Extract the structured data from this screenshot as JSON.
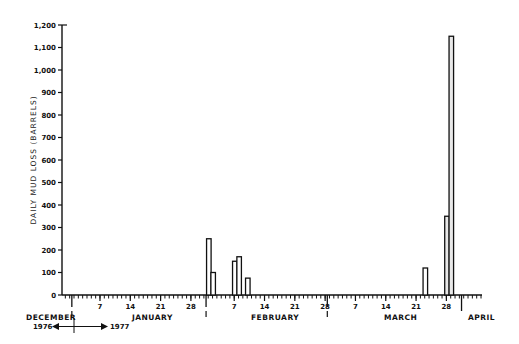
{
  "chart_data": {
    "type": "bar",
    "title": "",
    "xlabel": "",
    "ylabel": "DAILY MUD LOSS (BARRELS)",
    "ylim": [
      0,
      1200
    ],
    "yticks": [
      0,
      100,
      200,
      300,
      400,
      500,
      600,
      700,
      800,
      900,
      1000,
      1100,
      1200
    ],
    "ytick_labels": [
      "0",
      "100",
      "200",
      "300",
      "400",
      "500",
      "600",
      "700",
      "800",
      "900",
      "1,000",
      "1,100",
      "1,200"
    ],
    "grid": false,
    "x_day_ticks": [
      {
        "label": "7",
        "month": "January"
      },
      {
        "label": "14",
        "month": "January"
      },
      {
        "label": "21",
        "month": "January"
      },
      {
        "label": "28",
        "month": "January"
      },
      {
        "label": "7",
        "month": "February"
      },
      {
        "label": "14",
        "month": "February"
      },
      {
        "label": "21",
        "month": "February"
      },
      {
        "label": "28",
        "month": "February"
      },
      {
        "label": "7",
        "month": "March"
      },
      {
        "label": "14",
        "month": "March"
      },
      {
        "label": "21",
        "month": "March"
      },
      {
        "label": "28",
        "month": "March"
      }
    ],
    "month_labels": [
      "DECEMBER",
      "JANUARY",
      "FEBRUARY",
      "MARCH",
      "APRIL"
    ],
    "year_annotation": {
      "left": "1976",
      "right": "1977"
    },
    "categories": [
      "Feb 1",
      "Feb 2",
      "Feb 7",
      "Feb 8",
      "Feb 10",
      "Mar 23",
      "Mar 28",
      "Mar 29"
    ],
    "values": [
      250,
      100,
      150,
      170,
      75,
      120,
      350,
      1150
    ]
  },
  "axis": {
    "ylabel": "DAILY MUD LOSS (BARRELS)",
    "months": {
      "december": "DECEMBER",
      "january": "JANUARY",
      "february": "FEBRUARY",
      "march": "MARCH",
      "april": "APRIL"
    },
    "year_left": "1976",
    "year_right": "1977"
  }
}
